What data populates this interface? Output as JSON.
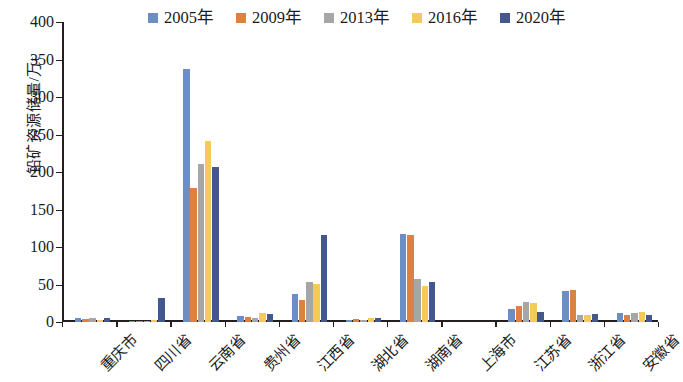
{
  "chart_data": {
    "type": "bar",
    "title": "",
    "xlabel": "",
    "ylabel": "铅矿资源储量/万t",
    "ylim": [
      0,
      400
    ],
    "ytick_step": 50,
    "yticks": [
      "400",
      "350",
      "300",
      "250",
      "200",
      "150",
      "100",
      "50",
      "0"
    ],
    "grid": false,
    "legend_position": "top",
    "categories": [
      "重庆市",
      "四川省",
      "云南省",
      "贵州省",
      "江西省",
      "湖北省",
      "湖南省",
      "上海市",
      "江苏省",
      "浙江省",
      "安徽省"
    ],
    "series": [
      {
        "name": "2005年",
        "color": "#6b8ec4",
        "values": [
          5,
          2,
          338,
          8,
          37,
          3,
          118,
          0,
          18,
          42,
          12
        ]
      },
      {
        "name": "2009年",
        "color": "#e0803f",
        "values": [
          4,
          2,
          179,
          7,
          30,
          4,
          116,
          0,
          22,
          43,
          10
        ]
      },
      {
        "name": "2013年",
        "color": "#a6a6a6",
        "values": [
          6,
          2,
          211,
          6,
          53,
          3,
          57,
          0,
          27,
          10,
          12
        ]
      },
      {
        "name": "2016年",
        "color": "#f6c95b",
        "values": [
          3,
          3,
          241,
          12,
          51,
          6,
          48,
          0,
          25,
          9,
          14
        ]
      },
      {
        "name": "2020年",
        "color": "#44578f",
        "values": [
          5,
          32,
          207,
          11,
          116,
          6,
          53,
          0,
          14,
          11,
          9
        ]
      }
    ]
  },
  "legend": {
    "items": [
      {
        "label": "2005年"
      },
      {
        "label": "2009年"
      },
      {
        "label": "2013年"
      },
      {
        "label": "2016年"
      },
      {
        "label": "2020年"
      }
    ]
  },
  "axis": {
    "y_title": "铅矿资源储量/万t"
  }
}
